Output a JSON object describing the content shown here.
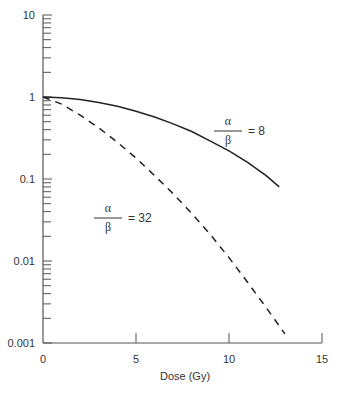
{
  "chart_data": {
    "type": "line",
    "title": "",
    "xlabel": "Dose (Gy)",
    "ylabel": "",
    "xlim": [
      0,
      15
    ],
    "ylim": [
      0.001,
      10
    ],
    "yscale": "log",
    "grid": false,
    "legend": "none (inline annotations)",
    "x_ticks": [
      "0",
      "5",
      "10",
      "15"
    ],
    "y_ticks": [
      "10",
      "1",
      "0.1",
      "0.01",
      "0.001"
    ],
    "series": [
      {
        "name": "α/β = 8",
        "style": "solid",
        "x": [
          0,
          1,
          2,
          3,
          4,
          5,
          6,
          7,
          8,
          9,
          10,
          11,
          12,
          12.7
        ],
        "y": [
          1.0,
          0.98,
          0.93,
          0.86,
          0.77,
          0.67,
          0.57,
          0.47,
          0.38,
          0.29,
          0.22,
          0.16,
          0.11,
          0.08
        ]
      },
      {
        "name": "α/β = 32",
        "style": "dashed",
        "x": [
          0,
          1,
          2,
          3,
          4,
          5,
          6,
          7,
          8,
          9,
          10,
          11,
          12,
          13
        ],
        "y": [
          1.0,
          0.82,
          0.6,
          0.42,
          0.28,
          0.18,
          0.11,
          0.066,
          0.038,
          0.021,
          0.011,
          0.0055,
          0.0027,
          0.0013
        ]
      }
    ],
    "annotations": [
      {
        "numerator": "α",
        "denominator": "β",
        "value": "= 8"
      },
      {
        "numerator": "α",
        "denominator": "β",
        "value": "= 32"
      }
    ]
  }
}
